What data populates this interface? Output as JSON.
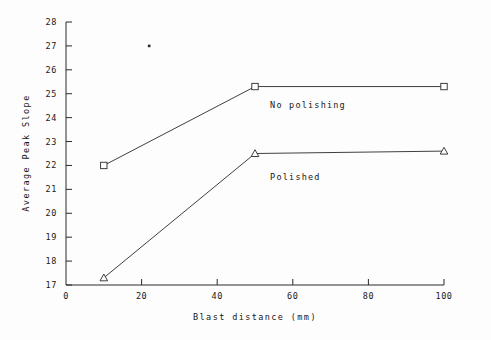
{
  "figure": {
    "background_color": "#fdfdfd",
    "ink_color": "#2a2a2a"
  },
  "chart_data": {
    "type": "line",
    "title": "",
    "xlabel": "Blast distance  (mm)",
    "ylabel": "Average Peak Slope",
    "xlim": [
      0,
      100
    ],
    "ylim": [
      17,
      28
    ],
    "xticks": [
      0,
      20,
      40,
      60,
      80,
      100
    ],
    "yticks": [
      17,
      18,
      19,
      20,
      21,
      22,
      23,
      24,
      25,
      26,
      27,
      28
    ],
    "xtick_labels": [
      "0",
      "20",
      "40",
      "60",
      "80",
      "100"
    ],
    "ytick_labels": [
      "17",
      "18",
      "19",
      "20",
      "21",
      "22",
      "23",
      "24",
      "25",
      "26",
      "27",
      "28"
    ],
    "grid": false,
    "legend": "inline-annotations",
    "x": [
      10,
      50,
      100
    ],
    "series": [
      {
        "name": "No polishing",
        "marker": "square",
        "values": [
          22.0,
          25.3,
          25.3
        ],
        "label_x": 54,
        "label_y": 24.4
      },
      {
        "name": "Polished",
        "marker": "triangle",
        "values": [
          17.3,
          22.5,
          22.6
        ],
        "label_x": 54,
        "label_y": 21.4
      }
    ],
    "annotations": [
      {
        "name": "stray-speck",
        "x": 22,
        "y": 27.0
      }
    ]
  }
}
